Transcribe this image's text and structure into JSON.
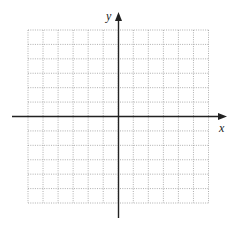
{
  "diagram": {
    "type": "coordinate-grid",
    "x_axis_label": "x",
    "y_axis_label": "y",
    "grid": {
      "columns": 12,
      "rows": 12,
      "line_style": "dotted",
      "line_color": "#9a9a9a"
    },
    "axis_color": "#222222",
    "origin_cell": {
      "column": 6,
      "row": 6
    }
  }
}
